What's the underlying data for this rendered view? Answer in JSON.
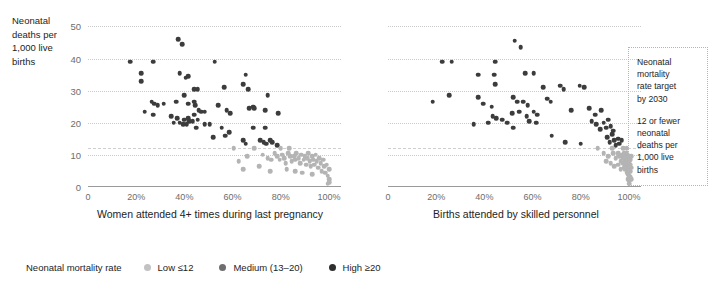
{
  "y_axis_title": "Neonatal\ndeaths per\n1,000 live\nbirths",
  "legend": {
    "title": "Neonatal mortality rate",
    "items": [
      {
        "label": "Low ≤12",
        "key": "low"
      },
      {
        "label": "Medium (13–20)",
        "key": "medium"
      },
      {
        "label": "High ≥20",
        "key": "high"
      }
    ]
  },
  "annotation": {
    "paragraph_1": "Neonatal\nmortality\nrate target\nby 2030",
    "paragraph_2": "12 or fewer\nneonatal\ndeaths per\n1,000 live\nbirths"
  },
  "colors": {
    "low": "#b4b4b4",
    "medium": "#707070",
    "high": "#3c3c3c",
    "gridline": "#c9c9c9",
    "axis": "#9a9a9a"
  },
  "chart_data": [
    {
      "type": "scatter",
      "title": "",
      "xlabel": "Women attended 4+ times during last pregnancy",
      "ylabel": "Neonatal deaths per 1,000 live births",
      "xlim": [
        0,
        105
      ],
      "ylim": [
        0,
        52
      ],
      "xticks": [
        0,
        20,
        40,
        60,
        80,
        100
      ],
      "xticklabels": [
        "0",
        "20%",
        "40%",
        "60%",
        "80%",
        "100%"
      ],
      "yticks": [
        0,
        10,
        20,
        30,
        40,
        50
      ],
      "yticklabels": [
        "0",
        "10",
        "20",
        "30",
        "40",
        "50"
      ],
      "gridlines_y": [
        10,
        12,
        20,
        30,
        40,
        50
      ],
      "target_line_y": 12,
      "grid": true,
      "legend_position": "bottom",
      "series": [
        {
          "name": "High ≥20",
          "color": "#3c3c3c",
          "points": [
            [
              17.5,
              39.0
            ],
            [
              22.0,
              35.5
            ],
            [
              22.0,
              33.0
            ],
            [
              27.0,
              39.0
            ],
            [
              37.5,
              46.0
            ],
            [
              39.0,
              44.5
            ],
            [
              26.5,
              26.5
            ],
            [
              27.5,
              26.0
            ],
            [
              29.0,
              25.5
            ],
            [
              31.5,
              26.0
            ],
            [
              23.5,
              23.5
            ],
            [
              27.0,
              22.5
            ],
            [
              38.0,
              35.5
            ],
            [
              40.5,
              34.0
            ],
            [
              41.5,
              34.5
            ],
            [
              40.0,
              28.5
            ],
            [
              44.0,
              30.5
            ],
            [
              45.5,
              30.5
            ],
            [
              44.0,
              26.5
            ],
            [
              41.5,
              26.0
            ],
            [
              36.5,
              26.5
            ],
            [
              44.5,
              25.5
            ],
            [
              46.0,
              24.0
            ],
            [
              34.5,
              22.0
            ],
            [
              37.0,
              21.5
            ],
            [
              40.0,
              21.0
            ],
            [
              41.5,
              21.5
            ],
            [
              44.0,
              22.5
            ],
            [
              47.0,
              23.5
            ],
            [
              48.5,
              23.5
            ],
            [
              35.5,
              20.0
            ],
            [
              38.0,
              20.0
            ],
            [
              39.5,
              19.5
            ],
            [
              41.0,
              19.5
            ],
            [
              42.0,
              20.5
            ],
            [
              43.5,
              20.5
            ],
            [
              45.5,
              21.0
            ],
            [
              52.5,
              39.0
            ],
            [
              56.5,
              31.0
            ],
            [
              64.5,
              32.0
            ],
            [
              66.5,
              30.5
            ],
            [
              65.5,
              35.0
            ],
            [
              54.0,
              25.5
            ],
            [
              57.5,
              24.0
            ],
            [
              59.0,
              23.0
            ],
            [
              67.0,
              24.5
            ],
            [
              68.5,
              25.0
            ],
            [
              69.0,
              24.5
            ],
            [
              74.5,
              28.5
            ],
            [
              73.5,
              24.0
            ],
            [
              79.0,
              23.0
            ],
            [
              50.5,
              19.5
            ],
            [
              45.0,
              18.5
            ],
            [
              48.5,
              19.5
            ],
            [
              55.5,
              18.5
            ],
            [
              58.5,
              17.0
            ],
            [
              68.5,
              18.5
            ],
            [
              73.5,
              18.5
            ],
            [
              52.0,
              15.5
            ],
            [
              57.0,
              16.0
            ],
            [
              64.5,
              14.5
            ],
            [
              65.5,
              13.5
            ],
            [
              71.5,
              14.5
            ],
            [
              73.0,
              14.0
            ],
            [
              74.0,
              13.5
            ],
            [
              75.5,
              14.5
            ],
            [
              76.5,
              14.0
            ],
            [
              78.5,
              13.0
            ]
          ]
        },
        {
          "name": "Low ≤12",
          "color": "#b4b4b4",
          "points": [
            [
              60.5,
              12.0
            ],
            [
              69.0,
              12.0
            ],
            [
              80.0,
              12.0
            ],
            [
              83.5,
              12.0
            ],
            [
              66.0,
              9.5
            ],
            [
              62.5,
              8.0
            ],
            [
              64.5,
              5.5
            ],
            [
              72.5,
              10.0
            ],
            [
              74.5,
              9.0
            ],
            [
              76.0,
              8.5
            ],
            [
              77.5,
              10.5
            ],
            [
              78.5,
              9.5
            ],
            [
              79.5,
              8.5
            ],
            [
              80.5,
              10.0
            ],
            [
              81.5,
              9.0
            ],
            [
              82.0,
              7.5
            ],
            [
              83.0,
              10.5
            ],
            [
              84.0,
              9.5
            ],
            [
              84.5,
              8.0
            ],
            [
              85.5,
              9.5
            ],
            [
              86.0,
              8.5
            ],
            [
              86.5,
              10.5
            ],
            [
              87.5,
              9.0
            ],
            [
              88.0,
              7.5
            ],
            [
              88.5,
              10.0
            ],
            [
              89.5,
              8.5
            ],
            [
              90.0,
              9.5
            ],
            [
              90.5,
              7.0
            ],
            [
              91.0,
              9.0
            ],
            [
              91.5,
              10.5
            ],
            [
              92.0,
              8.0
            ],
            [
              92.5,
              6.5
            ],
            [
              93.0,
              9.5
            ],
            [
              93.5,
              8.5
            ],
            [
              94.0,
              7.0
            ],
            [
              94.5,
              10.0
            ],
            [
              95.0,
              8.0
            ],
            [
              95.5,
              6.0
            ],
            [
              96.0,
              9.0
            ],
            [
              96.5,
              7.5
            ],
            [
              97.0,
              5.0
            ],
            [
              97.5,
              8.5
            ],
            [
              98.0,
              6.5
            ],
            [
              98.5,
              4.5
            ],
            [
              99.0,
              7.0
            ],
            [
              99.5,
              3.5
            ],
            [
              100.0,
              5.5
            ],
            [
              100.0,
              2.5
            ],
            [
              100.0,
              1.5
            ],
            [
              99.5,
              1.0
            ],
            [
              75.5,
              5.0
            ],
            [
              71.0,
              6.5
            ],
            [
              86.0,
              5.0
            ],
            [
              89.0,
              4.5
            ],
            [
              93.0,
              4.0
            ],
            [
              82.5,
              5.5
            ]
          ]
        }
      ]
    },
    {
      "type": "scatter",
      "title": "",
      "xlabel": "Births attended by skilled personnel",
      "ylabel": "Neonatal deaths per 1,000 live births",
      "xlim": [
        0,
        105
      ],
      "ylim": [
        0,
        52
      ],
      "xticks": [
        0,
        20,
        40,
        60,
        80,
        100
      ],
      "xticklabels": [
        "0",
        "20%",
        "40%",
        "60%",
        "80%",
        "100%"
      ],
      "yticks": [
        0,
        10,
        20,
        30,
        40,
        50
      ],
      "yticklabels": [
        "0",
        "10",
        "20",
        "30",
        "40",
        "50"
      ],
      "gridlines_y": [
        10,
        12,
        20,
        30,
        40,
        50
      ],
      "target_line_y": 12,
      "grid": true,
      "legend_position": "bottom",
      "series": [
        {
          "name": "High ≥20",
          "color": "#3c3c3c",
          "points": [
            [
              22.5,
              39.0
            ],
            [
              26.5,
              39.0
            ],
            [
              44.5,
              39.0
            ],
            [
              52.5,
              45.5
            ],
            [
              55.0,
              43.5
            ],
            [
              18.5,
              26.5
            ],
            [
              25.5,
              28.5
            ],
            [
              37.5,
              35.0
            ],
            [
              44.0,
              35.0
            ],
            [
              44.5,
              32.0
            ],
            [
              57.0,
              35.5
            ],
            [
              60.5,
              35.5
            ],
            [
              64.5,
              31.0
            ],
            [
              71.5,
              31.5
            ],
            [
              73.0,
              30.5
            ],
            [
              79.5,
              31.5
            ],
            [
              81.5,
              31.0
            ],
            [
              37.5,
              28.0
            ],
            [
              39.5,
              26.0
            ],
            [
              43.0,
              25.0
            ],
            [
              52.0,
              28.0
            ],
            [
              53.5,
              26.5
            ],
            [
              56.0,
              26.5
            ],
            [
              58.0,
              25.5
            ],
            [
              66.0,
              27.5
            ],
            [
              67.5,
              26.5
            ],
            [
              51.5,
              23.0
            ],
            [
              54.5,
              23.5
            ],
            [
              57.5,
              22.0
            ],
            [
              60.5,
              23.5
            ],
            [
              62.0,
              22.5
            ],
            [
              43.5,
              22.0
            ],
            [
              45.0,
              21.5
            ],
            [
              47.5,
              21.0
            ],
            [
              41.5,
              20.0
            ],
            [
              49.5,
              20.0
            ],
            [
              58.5,
              20.5
            ],
            [
              61.5,
              20.0
            ],
            [
              35.5,
              19.5
            ],
            [
              52.0,
              18.5
            ],
            [
              76.0,
              24.0
            ],
            [
              83.5,
              24.5
            ],
            [
              86.0,
              22.5
            ],
            [
              88.5,
              24.0
            ],
            [
              84.5,
              20.5
            ],
            [
              86.5,
              19.5
            ],
            [
              88.0,
              18.0
            ],
            [
              89.5,
              20.0
            ],
            [
              90.5,
              18.5
            ],
            [
              91.5,
              21.0
            ],
            [
              92.5,
              19.0
            ],
            [
              93.5,
              17.5
            ],
            [
              91.0,
              15.5
            ],
            [
              92.0,
              14.0
            ],
            [
              93.0,
              16.5
            ],
            [
              94.0,
              14.5
            ],
            [
              94.5,
              13.0
            ],
            [
              95.5,
              15.0
            ],
            [
              96.0,
              13.5
            ],
            [
              97.0,
              14.5
            ],
            [
              68.0,
              16.0
            ],
            [
              73.5,
              14.0
            ],
            [
              80.0,
              13.5
            ]
          ]
        },
        {
          "name": "Low ≤12",
          "color": "#b4b4b4",
          "points": [
            [
              87.0,
              12.0
            ],
            [
              93.0,
              12.0
            ],
            [
              97.5,
              12.0
            ],
            [
              99.0,
              12.0
            ],
            [
              89.5,
              10.5
            ],
            [
              91.5,
              9.5
            ],
            [
              93.5,
              10.5
            ],
            [
              94.5,
              9.0
            ],
            [
              95.5,
              10.5
            ],
            [
              96.0,
              9.5
            ],
            [
              96.5,
              8.0
            ],
            [
              97.0,
              10.0
            ],
            [
              97.5,
              9.0
            ],
            [
              97.5,
              7.5
            ],
            [
              98.0,
              10.5
            ],
            [
              98.0,
              9.0
            ],
            [
              98.0,
              7.5
            ],
            [
              98.0,
              6.0
            ],
            [
              98.5,
              10.0
            ],
            [
              98.5,
              8.5
            ],
            [
              98.5,
              7.0
            ],
            [
              98.5,
              5.5
            ],
            [
              99.0,
              10.5
            ],
            [
              99.0,
              9.0
            ],
            [
              99.0,
              7.5
            ],
            [
              99.0,
              6.0
            ],
            [
              99.0,
              4.5
            ],
            [
              99.5,
              10.0
            ],
            [
              99.5,
              8.5
            ],
            [
              99.5,
              7.0
            ],
            [
              99.5,
              5.5
            ],
            [
              99.5,
              4.0
            ],
            [
              99.5,
              2.5
            ],
            [
              100.0,
              9.5
            ],
            [
              100.0,
              8.0
            ],
            [
              100.0,
              6.5
            ],
            [
              100.0,
              5.0
            ],
            [
              100.0,
              3.5
            ],
            [
              100.0,
              2.0
            ],
            [
              100.0,
              1.0
            ],
            [
              100.5,
              8.5
            ],
            [
              100.5,
              7.0
            ],
            [
              100.5,
              5.0
            ],
            [
              100.5,
              3.0
            ],
            [
              96.5,
              5.5
            ],
            [
              95.5,
              7.0
            ],
            [
              94.0,
              6.5
            ],
            [
              92.5,
              7.5
            ],
            [
              90.5,
              8.0
            ],
            [
              101.0,
              9.5
            ],
            [
              101.0,
              6.0
            ],
            [
              101.0,
              2.5
            ]
          ]
        }
      ]
    }
  ]
}
